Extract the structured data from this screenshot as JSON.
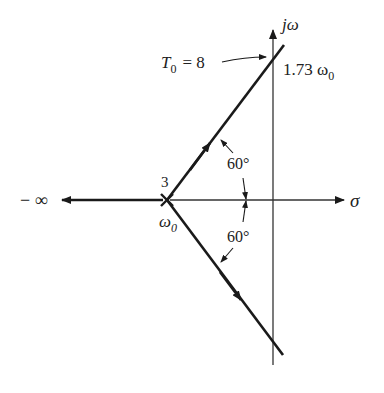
{
  "diagram": {
    "type": "root-locus",
    "colors": {
      "ink": "#1a1a1a",
      "axis": "#333333",
      "background": "#ffffff"
    },
    "axes": {
      "imag_label": "jω",
      "real_label": "σ"
    },
    "pole": {
      "multiplicity_label": "3",
      "location_label": "ω",
      "location_sub": "0"
    },
    "asymptote_left_label": "− ∞",
    "crossing": {
      "gain_label_main": "T",
      "gain_label_sub": "0",
      "gain_label_value": "= 8",
      "freq_label_value": "1.73 ω",
      "freq_label_sub": "0"
    },
    "angles": {
      "upper": "60°",
      "lower": "60°"
    }
  }
}
